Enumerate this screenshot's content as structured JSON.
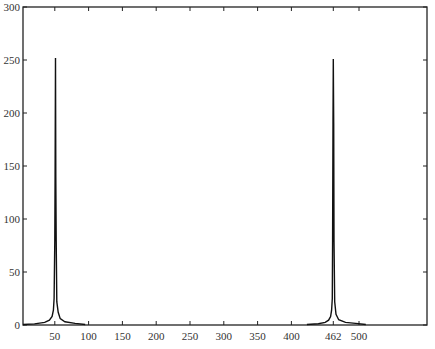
{
  "chart_data": {
    "type": "line",
    "title": "",
    "xlabel": "",
    "ylabel": "",
    "xlim": [
      0,
      600
    ],
    "ylim": [
      0,
      300
    ],
    "grid": false,
    "legend": null,
    "x_ticks": [
      50,
      100,
      150,
      200,
      250,
      300,
      350,
      400,
      462,
      500
    ],
    "x_tick_labels": [
      "50",
      "100",
      "150",
      "200",
      "250",
      "300",
      "350",
      "400",
      "462",
      "500"
    ],
    "y_ticks": [
      0,
      50,
      100,
      150,
      200,
      250,
      300
    ],
    "y_tick_labels": [
      "0",
      "50",
      "100",
      "150",
      "200",
      "250",
      "300"
    ],
    "series": [
      {
        "name": "spectrum-low",
        "x": [
          3,
          20,
          35,
          42,
          46,
          48,
          49,
          50,
          50.5,
          51,
          51.5,
          52,
          53,
          55,
          58,
          65,
          80,
          95
        ],
        "y": [
          0.5,
          1.0,
          2.5,
          4.5,
          8,
          14,
          25,
          80,
          140,
          252,
          140,
          80,
          22,
          12,
          6,
          3,
          1.5,
          0.5
        ]
      },
      {
        "name": "spectrum-high",
        "x": [
          423,
          440,
          450,
          455,
          458,
          459.5,
          460.5,
          461,
          461.5,
          462,
          462.5,
          463,
          464,
          466,
          470,
          480,
          495,
          510
        ],
        "y": [
          0.5,
          1.2,
          2.5,
          4.5,
          8,
          14,
          25,
          80,
          190,
          251,
          190,
          80,
          22,
          10,
          5,
          2.5,
          1.5,
          0.5
        ]
      }
    ],
    "annotations": [
      {
        "x": 51,
        "y": 252,
        "note": "peak near 50"
      },
      {
        "x": 462,
        "y": 251,
        "note": "peak at 462"
      }
    ]
  }
}
